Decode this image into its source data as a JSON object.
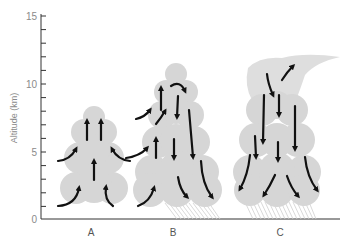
{
  "diagram": {
    "y_axis": {
      "label": "Altitude (km)",
      "ticks": [
        "0",
        "5",
        "10",
        "15"
      ],
      "range": [
        0,
        15
      ],
      "minor_tick_step": 1
    },
    "stages": [
      {
        "label": "A",
        "description": "Cumulus stage – updrafts only, air drawn in from sides"
      },
      {
        "label": "B",
        "description": "Mature stage – updrafts and downdrafts, precipitation falling"
      },
      {
        "label": "C",
        "description": "Dissipating stage – downdrafts dominate, anvil top, precipitation falling"
      }
    ],
    "colors": {
      "cloud": "#d6d6d6",
      "arrow": "#111111",
      "axis": "#333333",
      "text": "#8a8a8a",
      "rain": "#cfcfcf"
    }
  }
}
